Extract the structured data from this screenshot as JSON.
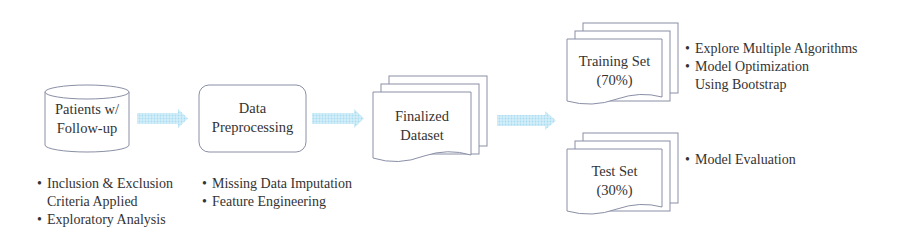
{
  "colors": {
    "shape_stroke": "#8a8fa6",
    "arrow_fill": "#bfe4f5",
    "text": "#333333"
  },
  "nodes": {
    "patients": {
      "line1": "Patients w/",
      "line2": "Follow-up",
      "shape": "cylinder-database"
    },
    "preprocessing": {
      "line1": "Data",
      "line2": "Preprocessing",
      "shape": "rounded-rectangle"
    },
    "finalized": {
      "line1": "Finalized",
      "line2": "Dataset",
      "shape": "multi-document"
    },
    "training": {
      "line1": "Training Set",
      "line2": "(70%)",
      "shape": "multi-document"
    },
    "test": {
      "line1": "Test Set",
      "line2": "(30%)",
      "shape": "multi-document"
    }
  },
  "notes": {
    "patients": [
      "Inclusion & Exclusion",
      "Criteria Applied",
      "Exploratory Analysis"
    ],
    "preprocessing": [
      "Missing Data Imputation",
      "Feature Engineering"
    ],
    "training": [
      "Explore Multiple Algorithms",
      "Model Optimization",
      "Using Bootstrap"
    ],
    "test": [
      "Model Evaluation"
    ]
  },
  "edges": [
    {
      "from": "patients",
      "to": "preprocessing"
    },
    {
      "from": "preprocessing",
      "to": "finalized"
    },
    {
      "from": "finalized",
      "to": "training"
    },
    {
      "from": "finalized",
      "to": "test"
    }
  ]
}
